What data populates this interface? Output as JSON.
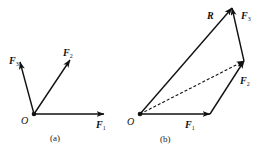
{
  "figure_a": {
    "caption": "(a)",
    "origin_label": "O",
    "vectors": [
      {
        "name": "F",
        "sub": "1",
        "from": [
          34,
          114
        ],
        "to": [
          104,
          114
        ]
      },
      {
        "name": "F",
        "sub": "2",
        "from": [
          34,
          114
        ],
        "to": [
          70,
          60
        ]
      },
      {
        "name": "F",
        "sub": "3",
        "from": [
          34,
          114
        ],
        "to": [
          20,
          62
        ]
      }
    ]
  },
  "figure_b": {
    "caption": "(b)",
    "origin_label": "O",
    "vectors": [
      {
        "name": "F",
        "sub": "1",
        "from": [
          140,
          114
        ],
        "to": [
          210,
          114
        ]
      },
      {
        "name": "F",
        "sub": "2",
        "from": [
          210,
          114
        ],
        "to": [
          244,
          61
        ]
      },
      {
        "name": "F",
        "sub": "3",
        "from": [
          244,
          61
        ],
        "to": [
          232,
          8
        ]
      },
      {
        "name": "R",
        "sub": "",
        "from": [
          140,
          114
        ],
        "to": [
          232,
          8
        ]
      }
    ],
    "dashed_resultant": {
      "from": [
        140,
        114
      ],
      "to": [
        244,
        61
      ]
    }
  },
  "labels": {
    "F": "F",
    "R": "R",
    "sub1": "1",
    "sub2": "2",
    "sub3": "3"
  },
  "colors": {
    "stroke": "#111111",
    "background": "#ffffff"
  }
}
